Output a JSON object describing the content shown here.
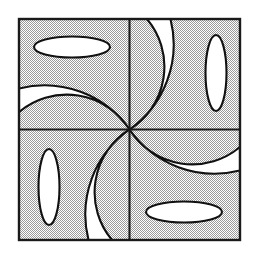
{
  "figure": {
    "title": "Four-quadrant pinwheel of crescents and ellipses",
    "type": "geometric-line-diagram",
    "canvas": {
      "width": 257,
      "height": 257,
      "background": "#ffffff"
    },
    "frame": {
      "name": "outer-square",
      "x": 19,
      "y": 19,
      "width": 221,
      "height": 221,
      "stroke": "#1a1a1a",
      "stroke_width": 2.4,
      "fill_pattern": "gray-halftone-dither",
      "fill_color": "#c9c9c9"
    },
    "center": {
      "x": 129.5,
      "y": 129.5
    },
    "divider_lines": [
      {
        "name": "vertical-divider",
        "x1": 129.5,
        "y1": 19,
        "x2": 129.5,
        "y2": 240
      },
      {
        "name": "horizontal-divider",
        "x1": 19,
        "y1": 129.5,
        "x2": 240,
        "y2": 129.5
      }
    ],
    "symmetry": "4-fold rotational (90 degrees) about center",
    "quadrants": [
      {
        "id": "top-left",
        "label": "Top Left",
        "ellipse": {
          "name": "horizontal-ellipse",
          "cx": 72,
          "cy": 47,
          "rx": 38,
          "ry": 10.5,
          "rotation": 0,
          "fill": "#ffffff"
        },
        "crescent": {
          "name": "crescent-opening-down-left",
          "orientation": "bulges-up",
          "fill": "#ffffff"
        }
      },
      {
        "id": "top-right",
        "label": "Top Right",
        "ellipse": {
          "name": "vertical-ellipse",
          "cx": 216,
          "cy": 73,
          "rx": 10.5,
          "ry": 38,
          "rotation": 0,
          "fill": "#ffffff"
        },
        "crescent": {
          "name": "crescent-opening-up-left",
          "orientation": "bulges-right",
          "fill": "#ffffff"
        }
      },
      {
        "id": "bottom-left",
        "label": "Bottom Left",
        "ellipse": {
          "name": "vertical-ellipse",
          "cx": 49,
          "cy": 187,
          "rx": 10.5,
          "ry": 38,
          "rotation": 0,
          "fill": "#ffffff"
        },
        "crescent": {
          "name": "crescent-opening-down-right",
          "orientation": "bulges-left",
          "fill": "#ffffff"
        }
      },
      {
        "id": "bottom-right",
        "label": "Bottom Right",
        "ellipse": {
          "name": "horizontal-ellipse",
          "cx": 184,
          "cy": 212,
          "rx": 38,
          "ry": 10.5,
          "rotation": 0,
          "fill": "#ffffff"
        },
        "crescent": {
          "name": "crescent-opening-up-right",
          "orientation": "bulges-down",
          "fill": "#ffffff"
        }
      }
    ],
    "colors": {
      "line": "#111111",
      "frame_line": "#1a1a1a",
      "shape_fill": "#ffffff",
      "background_fill": "#c9c9c9",
      "page_background": "#ffffff"
    }
  }
}
